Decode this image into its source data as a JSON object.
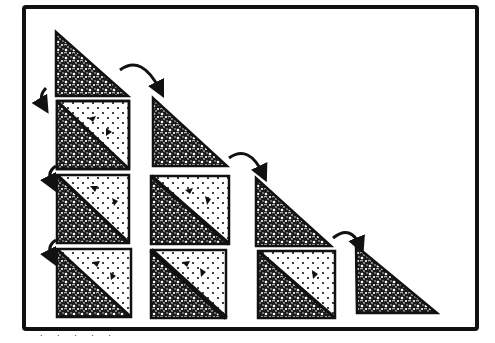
{
  "diagram": {
    "type": "quilt-piecing-diagram",
    "colors": {
      "background": "#ffffff",
      "ink": "#111111",
      "dark_fabric": "#1a1a1a",
      "light_fabric": "#ffffff"
    },
    "frame": {
      "x": 22,
      "y": 6,
      "w": 456,
      "h": 324
    },
    "columns": [
      {
        "id": "col-1",
        "triangle": {
          "x": 56,
          "y": 32,
          "w": 72,
          "h": 64
        },
        "squares": [
          {
            "x": 57,
            "y": 101,
            "w": 72,
            "h": 68
          },
          {
            "x": 57,
            "y": 175,
            "w": 72,
            "h": 68
          },
          {
            "x": 57,
            "y": 249,
            "w": 74,
            "h": 68
          }
        ],
        "arrows": [
          {
            "from": [
              42,
              90
            ],
            "to": [
              46,
              110
            ],
            "kind": "small-left"
          },
          {
            "from": [
              50,
              166
            ],
            "to": [
              52,
              184
            ],
            "kind": "small-left"
          },
          {
            "from": [
              50,
              240
            ],
            "to": [
              52,
              258
            ],
            "kind": "small-left"
          }
        ]
      },
      {
        "id": "col-2",
        "triangle": {
          "x": 153,
          "y": 98,
          "w": 74,
          "h": 68
        },
        "squares": [
          {
            "x": 151,
            "y": 176,
            "w": 78,
            "h": 68
          },
          {
            "x": 151,
            "y": 250,
            "w": 75,
            "h": 68
          }
        ],
        "arrows": [
          {
            "from": [
              120,
              70
            ],
            "to": [
              160,
              92
            ],
            "kind": "arc-right"
          }
        ]
      },
      {
        "id": "col-3",
        "triangle": {
          "x": 256,
          "y": 178,
          "w": 75,
          "h": 68
        },
        "squares": [
          {
            "x": 258,
            "y": 251,
            "w": 77,
            "h": 67
          }
        ],
        "arrows": [
          {
            "from": [
              228,
              160
            ],
            "to": [
              263,
              175
            ],
            "kind": "arc-right"
          }
        ]
      },
      {
        "id": "col-4",
        "triangle": {
          "x": 356,
          "y": 246,
          "w": 81,
          "h": 67
        },
        "squares": [],
        "arrows": [
          {
            "from": [
              333,
              238
            ],
            "to": [
              360,
              245
            ],
            "kind": "arc-right"
          }
        ]
      }
    ],
    "caption_fragment": "· ·  ·  ·  ·"
  }
}
